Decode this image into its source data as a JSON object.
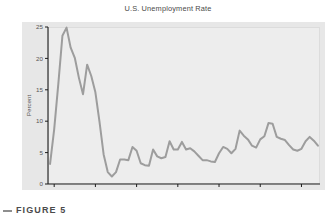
{
  "figure": {
    "title": "U.S. Unemployment Rate",
    "caption_marker": "dash-marker",
    "caption": "FIGURE 5",
    "panel_color": "#e7e7e7",
    "plot_color": "#ededed",
    "line_color": "#9d9d9d",
    "axis_color": "#1c1c1c",
    "label_color": "#555555"
  },
  "chart_data": {
    "type": "line",
    "title": "U.S. Unemployment Rate",
    "xlabel": "",
    "ylabel": "Percent",
    "xlim": [
      1928.5,
      1994.5
    ],
    "ylim": [
      0,
      25
    ],
    "xticks": [
      1930,
      1940,
      1950,
      1960,
      1970,
      1980,
      1990
    ],
    "yticks": [
      0,
      5,
      10,
      15,
      20,
      25
    ],
    "grid": false,
    "legend": "none",
    "series": [
      {
        "name": "Unemployment Rate",
        "color": "#9d9d9d",
        "x": [
          1929,
          1930,
          1931,
          1932,
          1933,
          1934,
          1935,
          1936,
          1937,
          1938,
          1939,
          1940,
          1941,
          1942,
          1943,
          1944,
          1945,
          1946,
          1947,
          1948,
          1949,
          1950,
          1951,
          1952,
          1953,
          1954,
          1955,
          1956,
          1957,
          1958,
          1959,
          1960,
          1961,
          1962,
          1963,
          1964,
          1965,
          1966,
          1967,
          1968,
          1969,
          1970,
          1971,
          1972,
          1973,
          1974,
          1975,
          1976,
          1977,
          1978,
          1979,
          1980,
          1981,
          1982,
          1983,
          1984,
          1985,
          1986,
          1987,
          1988,
          1989,
          1990,
          1991,
          1992,
          1993,
          1994
        ],
        "values": [
          3.2,
          8.7,
          15.9,
          23.6,
          24.9,
          21.7,
          20.1,
          16.9,
          14.3,
          19.0,
          17.2,
          14.6,
          9.9,
          4.7,
          1.9,
          1.2,
          1.9,
          3.9,
          3.9,
          3.8,
          5.9,
          5.3,
          3.3,
          3.0,
          2.9,
          5.5,
          4.4,
          4.1,
          4.3,
          6.8,
          5.5,
          5.5,
          6.7,
          5.5,
          5.7,
          5.2,
          4.5,
          3.8,
          3.8,
          3.6,
          3.5,
          4.9,
          5.9,
          5.6,
          4.9,
          5.6,
          8.5,
          7.7,
          7.1,
          6.1,
          5.8,
          7.1,
          7.6,
          9.7,
          9.6,
          7.5,
          7.2,
          7.0,
          6.2,
          5.5,
          5.3,
          5.6,
          6.8,
          7.5,
          6.9,
          6.1
        ]
      }
    ]
  }
}
